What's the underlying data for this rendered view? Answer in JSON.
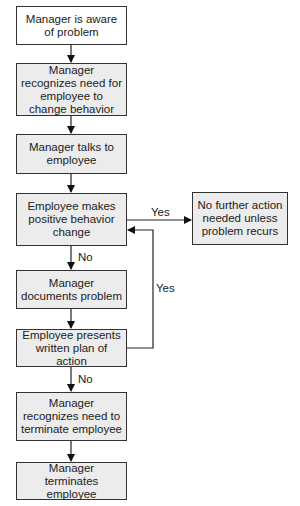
{
  "diagram": {
    "type": "flowchart",
    "nodes": [
      {
        "id": "n1",
        "label": "Manager is aware of problem"
      },
      {
        "id": "n2",
        "label": "Manager recognizes need for employee to change behavior"
      },
      {
        "id": "n3",
        "label": "Manager talks to employee"
      },
      {
        "id": "n4",
        "label": "Employee makes positive behavior change"
      },
      {
        "id": "n5",
        "label": "Manager documents problem"
      },
      {
        "id": "n6",
        "label": "Employee presents written plan of action"
      },
      {
        "id": "n7",
        "label": "Manager recognizes need to terminate employee"
      },
      {
        "id": "n8",
        "label": "Manager terminates employee"
      },
      {
        "id": "n9",
        "label": "No further action needed unless problem recurs"
      }
    ],
    "edges": [
      {
        "from": "n1",
        "to": "n2",
        "label": ""
      },
      {
        "from": "n2",
        "to": "n3",
        "label": ""
      },
      {
        "from": "n3",
        "to": "n4",
        "label": ""
      },
      {
        "from": "n4",
        "to": "n9",
        "label": "Yes"
      },
      {
        "from": "n4",
        "to": "n5",
        "label": "No"
      },
      {
        "from": "n5",
        "to": "n6",
        "label": ""
      },
      {
        "from": "n6",
        "to": "n4",
        "label": "Yes"
      },
      {
        "from": "n6",
        "to": "n7",
        "label": "No"
      },
      {
        "from": "n7",
        "to": "n8",
        "label": ""
      }
    ],
    "edge_labels": {
      "yes_right": "Yes",
      "no_down_1": "No",
      "yes_loop": "Yes",
      "no_down_2": "No"
    }
  }
}
